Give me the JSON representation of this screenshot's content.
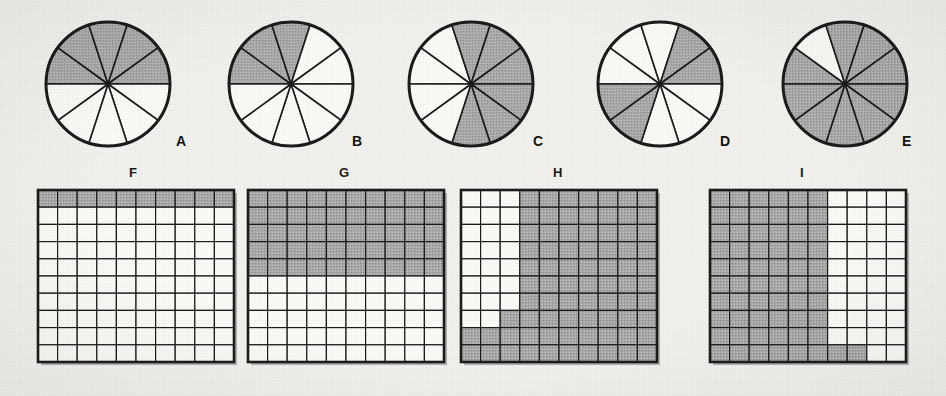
{
  "page": {
    "background_color": "#f3f1ed",
    "shade_color": "#a9a9a9",
    "unshaded_color": "#fbfaf7",
    "line_color": "#1c1c1c",
    "caption": ""
  },
  "figures": {
    "circles": [
      {
        "label": "A",
        "shape": "circle",
        "total_parts": 10,
        "shaded_parts": 5,
        "fraction": "5/10",
        "shaded_indices": [
          0,
          1,
          2,
          3,
          4
        ],
        "start_angle_deg": 180,
        "cx": 108,
        "cy": 84,
        "r": 62,
        "label_x": 176,
        "label_y": 134
      },
      {
        "label": "B",
        "shape": "circle",
        "total_parts": 10,
        "shaded_parts": 3,
        "fraction": "3/10",
        "shaded_indices": [
          0,
          1,
          2
        ],
        "start_angle_deg": 180,
        "cx": 291,
        "cy": 84,
        "r": 62,
        "label_x": 352,
        "label_y": 134
      },
      {
        "label": "C",
        "shape": "circle",
        "total_parts": 10,
        "shaded_parts": 6,
        "fraction": "6/10",
        "shaded_indices": [
          2,
          3,
          4,
          5,
          6,
          7
        ],
        "start_angle_deg": 180,
        "cx": 471,
        "cy": 84,
        "r": 62,
        "label_x": 533,
        "label_y": 134
      },
      {
        "label": "D",
        "shape": "circle",
        "total_parts": 10,
        "shaded_parts": 4,
        "fraction": "4/10",
        "shaded_indices": [
          3,
          4,
          9,
          8
        ],
        "start_angle_deg": 180,
        "cx": 660,
        "cy": 84,
        "r": 62,
        "label_x": 720,
        "label_y": 134
      },
      {
        "label": "E",
        "shape": "circle",
        "total_parts": 10,
        "shaded_parts": 9,
        "fraction": "9/10",
        "shaded_indices": [
          0,
          2,
          3,
          4,
          5,
          6,
          7,
          8,
          9
        ],
        "start_angle_deg": 180,
        "cx": 845,
        "cy": 84,
        "r": 62,
        "label_x": 902,
        "label_y": 134
      }
    ],
    "grids": [
      {
        "label": "F",
        "shape": "grid",
        "rows": 10,
        "cols": 10,
        "total_parts": 100,
        "shaded_parts": 10,
        "fraction": "10/100",
        "shaded_cells": [
          [
            1,
            1,
            1,
            1,
            1,
            1,
            1,
            1,
            1,
            1
          ],
          [
            0,
            0,
            0,
            0,
            0,
            0,
            0,
            0,
            0,
            0
          ],
          [
            0,
            0,
            0,
            0,
            0,
            0,
            0,
            0,
            0,
            0
          ],
          [
            0,
            0,
            0,
            0,
            0,
            0,
            0,
            0,
            0,
            0
          ],
          [
            0,
            0,
            0,
            0,
            0,
            0,
            0,
            0,
            0,
            0
          ],
          [
            0,
            0,
            0,
            0,
            0,
            0,
            0,
            0,
            0,
            0
          ],
          [
            0,
            0,
            0,
            0,
            0,
            0,
            0,
            0,
            0,
            0
          ],
          [
            0,
            0,
            0,
            0,
            0,
            0,
            0,
            0,
            0,
            0
          ],
          [
            0,
            0,
            0,
            0,
            0,
            0,
            0,
            0,
            0,
            0
          ],
          [
            0,
            0,
            0,
            0,
            0,
            0,
            0,
            0,
            0,
            0
          ]
        ],
        "x": 38,
        "y": 190,
        "w": 196,
        "h": 172,
        "label_x": 129,
        "label_y": 166
      },
      {
        "label": "G",
        "shape": "grid",
        "rows": 10,
        "cols": 10,
        "total_parts": 100,
        "shaded_parts": 50,
        "fraction": "50/100",
        "shaded_cells": [
          [
            1,
            1,
            1,
            1,
            1,
            1,
            1,
            1,
            1,
            1
          ],
          [
            1,
            1,
            1,
            1,
            1,
            1,
            1,
            1,
            1,
            1
          ],
          [
            1,
            1,
            1,
            1,
            1,
            1,
            1,
            1,
            1,
            1
          ],
          [
            1,
            1,
            1,
            1,
            1,
            1,
            1,
            1,
            1,
            1
          ],
          [
            1,
            1,
            1,
            1,
            1,
            1,
            1,
            1,
            1,
            1
          ],
          [
            0,
            0,
            0,
            0,
            0,
            0,
            0,
            0,
            0,
            0
          ],
          [
            0,
            0,
            0,
            0,
            0,
            0,
            0,
            0,
            0,
            0
          ],
          [
            0,
            0,
            0,
            0,
            0,
            0,
            0,
            0,
            0,
            0
          ],
          [
            0,
            0,
            0,
            0,
            0,
            0,
            0,
            0,
            0,
            0
          ],
          [
            0,
            0,
            0,
            0,
            0,
            0,
            0,
            0,
            0,
            0
          ]
        ],
        "x": 248,
        "y": 190,
        "w": 196,
        "h": 172,
        "label_x": 339,
        "label_y": 166
      },
      {
        "label": "H",
        "shape": "grid",
        "rows": 10,
        "cols": 10,
        "total_parts": 100,
        "shaded_parts": 77,
        "fraction": "77/100",
        "shaded_cells": [
          [
            0,
            0,
            0,
            1,
            1,
            1,
            1,
            1,
            1,
            1
          ],
          [
            0,
            0,
            0,
            1,
            1,
            1,
            1,
            1,
            1,
            1
          ],
          [
            0,
            0,
            0,
            1,
            1,
            1,
            1,
            1,
            1,
            1
          ],
          [
            0,
            0,
            0,
            1,
            1,
            1,
            1,
            1,
            1,
            1
          ],
          [
            0,
            0,
            0,
            1,
            1,
            1,
            1,
            1,
            1,
            1
          ],
          [
            0,
            0,
            0,
            1,
            1,
            1,
            1,
            1,
            1,
            1
          ],
          [
            0,
            0,
            0,
            1,
            1,
            1,
            1,
            1,
            1,
            1
          ],
          [
            0,
            0,
            1,
            1,
            1,
            1,
            1,
            1,
            1,
            1
          ],
          [
            1,
            1,
            1,
            1,
            1,
            1,
            1,
            1,
            1,
            1
          ],
          [
            1,
            1,
            1,
            1,
            1,
            1,
            1,
            1,
            1,
            1
          ]
        ],
        "x": 461,
        "y": 190,
        "w": 196,
        "h": 172,
        "label_x": 553,
        "label_y": 166
      },
      {
        "label": "I",
        "shape": "grid",
        "rows": 10,
        "cols": 10,
        "total_parts": 100,
        "shaded_parts": 62,
        "fraction": "62/100",
        "shaded_cells": [
          [
            1,
            1,
            1,
            1,
            1,
            1,
            0,
            0,
            0,
            0
          ],
          [
            1,
            1,
            1,
            1,
            1,
            1,
            0,
            0,
            0,
            0
          ],
          [
            1,
            1,
            1,
            1,
            1,
            1,
            0,
            0,
            0,
            0
          ],
          [
            1,
            1,
            1,
            1,
            1,
            1,
            0,
            0,
            0,
            0
          ],
          [
            1,
            1,
            1,
            1,
            1,
            1,
            0,
            0,
            0,
            0
          ],
          [
            1,
            1,
            1,
            1,
            1,
            1,
            0,
            0,
            0,
            0
          ],
          [
            1,
            1,
            1,
            1,
            1,
            1,
            0,
            0,
            0,
            0
          ],
          [
            1,
            1,
            1,
            1,
            1,
            1,
            0,
            0,
            0,
            0
          ],
          [
            1,
            1,
            1,
            1,
            1,
            1,
            0,
            0,
            0,
            0
          ],
          [
            1,
            1,
            1,
            1,
            1,
            1,
            1,
            1,
            0,
            0
          ]
        ],
        "x": 710,
        "y": 190,
        "w": 196,
        "h": 172,
        "label_x": 800,
        "label_y": 166
      }
    ]
  }
}
